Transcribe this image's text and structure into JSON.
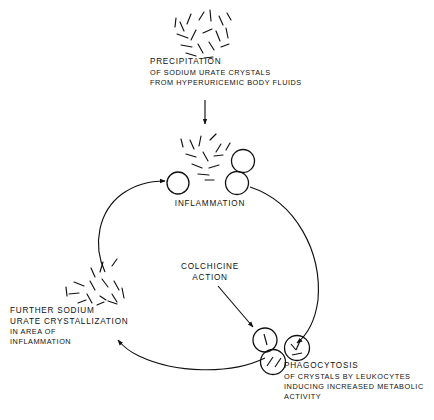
{
  "diagram": {
    "type": "cycle-flow-diagram",
    "ink_color": "#111111",
    "background_color": "#ffffff",
    "nodes": [
      {
        "id": "precipitation",
        "heading": "PRECIPITATION",
        "lines": [
          "OF SODIUM URATE CRYSTALS",
          "FROM HYPERURICEMIC BODY FLUIDS"
        ],
        "glyph": "crystal-cluster"
      },
      {
        "id": "inflammation",
        "heading": "INFLAMMATION",
        "lines": [],
        "glyph": "leukocytes-empty"
      },
      {
        "id": "colchicine",
        "heading": "COLCHICINE",
        "lines": [
          "ACTION"
        ],
        "glyph": "arrow-only"
      },
      {
        "id": "phagocytosis",
        "heading": "PHAGOCYTOSIS",
        "lines": [
          "OF CRYSTALS BY LEUKOCYTES",
          "INDUCING INCREASED METABOLIC",
          "ACTIVITY"
        ],
        "glyph": "leukocytes-with-crystals"
      },
      {
        "id": "further-crystallization",
        "heading": "FURTHER SODIUM",
        "heading2": "URATE CRYSTALLIZATION",
        "lines": [
          "IN AREA OF",
          "INFLAMMATION"
        ],
        "glyph": "crystal-cluster"
      }
    ],
    "edges": [
      {
        "id": "precipitation-to-inflammation",
        "from": "precipitation",
        "to": "inflammation",
        "shape": "straight-down"
      },
      {
        "id": "inflammation-to-phagocytosis",
        "from": "inflammation",
        "to": "phagocytosis",
        "shape": "arc-clockwise-right"
      },
      {
        "id": "phagocytosis-to-further",
        "from": "phagocytosis",
        "to": "further-crystallization",
        "shape": "arc-clockwise-bottom"
      },
      {
        "id": "further-to-inflammation",
        "from": "further-crystallization",
        "to": "inflammation",
        "shape": "arc-clockwise-left"
      },
      {
        "id": "colchicine-to-phagocytosis",
        "from": "colchicine",
        "to": "phagocytosis",
        "shape": "straight-diagonal"
      }
    ]
  }
}
